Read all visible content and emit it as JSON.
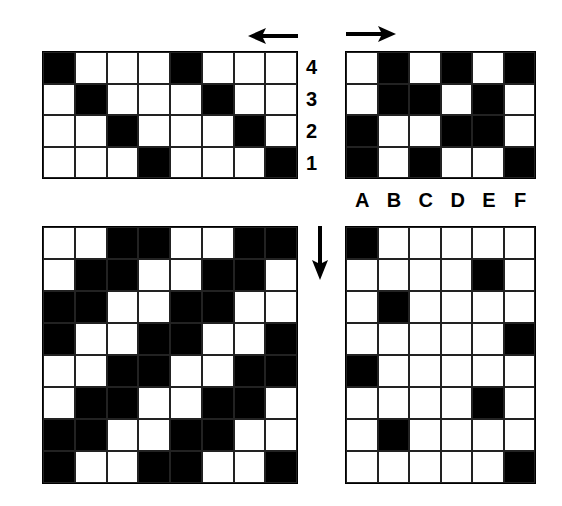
{
  "threading": {
    "columns": 8,
    "rows": 4,
    "row_labels": [
      "4",
      "3",
      "2",
      "1"
    ],
    "cells": [
      [
        1,
        0,
        0,
        0,
        1,
        0,
        0,
        0
      ],
      [
        0,
        1,
        0,
        0,
        0,
        1,
        0,
        0
      ],
      [
        0,
        0,
        1,
        0,
        0,
        0,
        1,
        0
      ],
      [
        0,
        0,
        0,
        1,
        0,
        0,
        0,
        1
      ]
    ],
    "direction_arrow": "left"
  },
  "tieup": {
    "columns": 6,
    "rows": 4,
    "column_labels": [
      "A",
      "B",
      "C",
      "D",
      "E",
      "F"
    ],
    "cells": [
      [
        0,
        1,
        0,
        1,
        0,
        1
      ],
      [
        0,
        1,
        1,
        0,
        1,
        0
      ],
      [
        1,
        0,
        0,
        1,
        1,
        0
      ],
      [
        1,
        0,
        1,
        0,
        0,
        1
      ]
    ],
    "direction_arrow": "right"
  },
  "drawdown": {
    "columns": 8,
    "rows": 8,
    "cells": [
      [
        0,
        0,
        1,
        1,
        0,
        0,
        1,
        1
      ],
      [
        0,
        1,
        1,
        0,
        0,
        1,
        1,
        0
      ],
      [
        1,
        1,
        0,
        0,
        1,
        1,
        0,
        0
      ],
      [
        1,
        0,
        0,
        1,
        1,
        0,
        0,
        1
      ],
      [
        0,
        0,
        1,
        1,
        0,
        0,
        1,
        1
      ],
      [
        0,
        1,
        1,
        0,
        0,
        1,
        1,
        0
      ],
      [
        1,
        1,
        0,
        0,
        1,
        1,
        0,
        0
      ],
      [
        1,
        0,
        0,
        1,
        1,
        0,
        0,
        1
      ]
    ],
    "direction_arrow": "down"
  },
  "treadling": {
    "columns": 6,
    "rows": 8,
    "cells": [
      [
        1,
        0,
        0,
        0,
        0,
        0
      ],
      [
        0,
        0,
        0,
        0,
        1,
        0
      ],
      [
        0,
        1,
        0,
        0,
        0,
        0
      ],
      [
        0,
        0,
        0,
        0,
        0,
        1
      ],
      [
        1,
        0,
        0,
        0,
        0,
        0
      ],
      [
        0,
        0,
        0,
        0,
        1,
        0
      ],
      [
        0,
        1,
        0,
        0,
        0,
        0
      ],
      [
        0,
        0,
        0,
        0,
        0,
        1
      ]
    ]
  }
}
